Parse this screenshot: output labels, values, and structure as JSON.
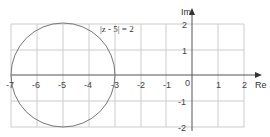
{
  "diagram": {
    "title": "",
    "equation_label": "|z - 5| = 2",
    "axes": {
      "x_label": "Re",
      "y_label": "Im",
      "x_ticks": [
        "-7",
        "-6",
        "-5",
        "-4",
        "-3",
        "-2",
        "-1",
        "0",
        "1",
        "2"
      ],
      "y_ticks": [
        "2",
        "1",
        "-1",
        "-2"
      ],
      "x_range": [
        -7,
        2
      ],
      "y_range": [
        -2,
        2
      ]
    },
    "circle": {
      "center": [
        -5,
        0
      ],
      "radius": 2
    },
    "colors": {
      "grid": "#cccccc",
      "axis": "#555555",
      "circle": "#777777",
      "text": "#333333"
    }
  }
}
